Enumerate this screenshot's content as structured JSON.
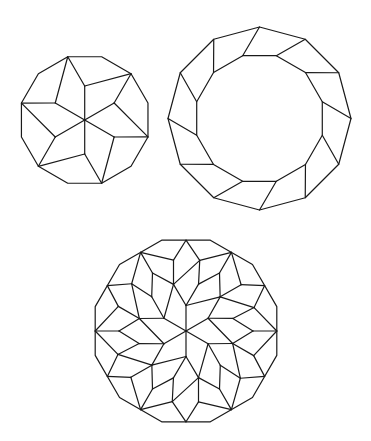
{
  "canvas": {
    "width": 371,
    "height": 441,
    "background": "#ffffff",
    "stroke": "#1a1a1a"
  },
  "figures": [
    {
      "id": "dodecagon-six-point-star",
      "description": "Regular dodecagon dissected into a 6-point star of rhombi and 6 outer quadrilaterals",
      "center": [
        84.7,
        120
      ],
      "outer_radius": 65.5,
      "outer_vertex_offset_deg": 15,
      "spoke_length": 34,
      "tip_offset_deg": 45
    },
    {
      "id": "dodecagon-rhombus-ring",
      "description": "Ring of 12 quadrilaterals between an outer and an inner dodecagon",
      "center": [
        259.5,
        118.5
      ],
      "outer_radius": 91.5,
      "outer_vertex_offset_deg": 0,
      "inner_radius": 65,
      "inner_vertex_offset_deg": 15
    },
    {
      "id": "dodecagon-rosette",
      "description": "Large dodecagon (side subdivided) tiled as a 6-fold rhombic rosette",
      "center": [
        186,
        331
      ],
      "outer_radius": 94,
      "spoke_radius": 25.5,
      "L": {
        "r": 48.5,
        "off": 15
      },
      "K": {
        "r": 48.3,
        "off": 45
      },
      "I": {
        "r": 72,
        "off": 11
      },
      "J": {
        "r": 67,
        "off": 30
      },
      "N": {
        "r": 72,
        "off": 50
      }
    }
  ]
}
